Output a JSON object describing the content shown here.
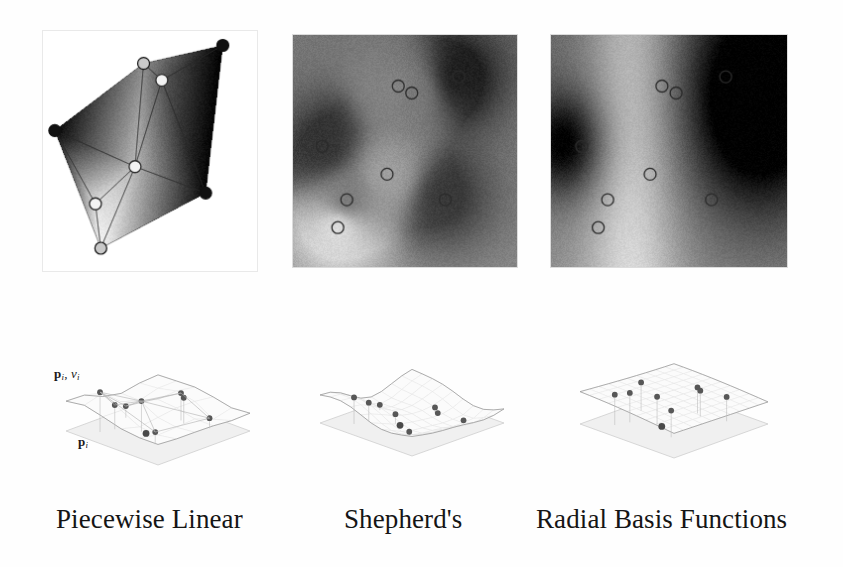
{
  "figure": {
    "kind": "scattered-data-interpolation-comparison",
    "background_color": "#ffffff",
    "ink_color": "#151515"
  },
  "panels": [
    {
      "id": "piecewise",
      "caption": "Piecewise Linear",
      "top_view_type": "triangulated-gradient-polygon",
      "bottom_view_type": "faceted-triangulated-surface",
      "border_color": "#e9e9e9"
    },
    {
      "id": "shepherds",
      "caption": "Shepherd's",
      "top_view_type": "grayscale-field-local-bumps",
      "bottom_view_type": "smooth-surface-with-flat-plateau",
      "border_color": "#dcdcdc"
    },
    {
      "id": "rbf",
      "caption": "Radial Basis Functions",
      "top_view_type": "grayscale-field-global-smooth",
      "bottom_view_type": "smooth-undulating-surface",
      "border_color": "#dcdcdc"
    }
  ],
  "labels": {
    "samples_with_values": {
      "symbol": "p",
      "subscript": "i",
      "value_symbol": "v",
      "value_subscript": "i",
      "separator": ", "
    },
    "samples_domain": {
      "symbol": "p",
      "subscript": "i"
    }
  },
  "chart_data": {
    "type": "heatmap",
    "title": "",
    "xlabel": "",
    "ylabel": "",
    "grid": false,
    "legend": "none",
    "xlim": [
      0,
      1
    ],
    "ylim": [
      0,
      1
    ],
    "zlim": [
      0,
      1
    ],
    "scatter_points": [
      {
        "name": "s1",
        "x": 0.47,
        "y": 0.22,
        "value": 0.52
      },
      {
        "name": "s2",
        "x": 0.53,
        "y": 0.25,
        "value": 0.46
      },
      {
        "name": "s3",
        "x": 0.74,
        "y": 0.18,
        "value": 0.04
      },
      {
        "name": "s4",
        "x": 0.13,
        "y": 0.48,
        "value": 0.08
      },
      {
        "name": "s5",
        "x": 0.42,
        "y": 0.6,
        "value": 0.6
      },
      {
        "name": "s6",
        "x": 0.24,
        "y": 0.71,
        "value": 0.4
      },
      {
        "name": "s7",
        "x": 0.68,
        "y": 0.71,
        "value": 0.1
      },
      {
        "name": "s8",
        "x": 0.2,
        "y": 0.83,
        "value": 0.86
      }
    ],
    "marker_style": {
      "shape": "circle",
      "fill": "none",
      "stroke": "#2b2b2b",
      "radius_px": 6
    },
    "series": [
      {
        "name": "Piecewise Linear",
        "panel": "piecewise",
        "colormap": "gray",
        "hull_vertices": [
          {
            "x": 0.055,
            "y": 0.415,
            "value": 0.02
          },
          {
            "x": 0.47,
            "y": 0.135,
            "value": 0.55
          },
          {
            "x": 0.84,
            "y": 0.06,
            "value": 0.0
          },
          {
            "x": 0.76,
            "y": 0.675,
            "value": 0.02
          },
          {
            "x": 0.27,
            "y": 0.905,
            "value": 0.96
          }
        ],
        "interior_vertices": [
          {
            "x": 0.555,
            "y": 0.205,
            "value": 0.35
          },
          {
            "x": 0.43,
            "y": 0.565,
            "value": 0.72
          },
          {
            "x": 0.245,
            "y": 0.72,
            "value": 0.88
          }
        ],
        "triangles": [
          [
            0,
            1,
            6
          ],
          [
            1,
            5,
            6
          ],
          [
            1,
            2,
            5
          ],
          [
            2,
            3,
            5
          ],
          [
            3,
            5,
            6
          ],
          [
            3,
            4,
            6
          ],
          [
            4,
            6,
            7
          ],
          [
            0,
            6,
            7
          ],
          [
            0,
            4,
            7
          ]
        ]
      },
      {
        "name": "Shepherd's",
        "panel": "shepherds",
        "colormap": "gray",
        "field_model": "inverse-distance-weighted",
        "background_value": 0.46,
        "influence_radius": 0.16,
        "note": "Sharp local extrema at each sample, flat mid-gray elsewhere"
      },
      {
        "name": "Radial Basis Functions",
        "panel": "rbf",
        "colormap": "gray",
        "field_model": "thin-plate-global",
        "influence_radius": 0.55,
        "note": "Broad smooth bright band through the centre, large dark lobes left and right"
      }
    ]
  }
}
